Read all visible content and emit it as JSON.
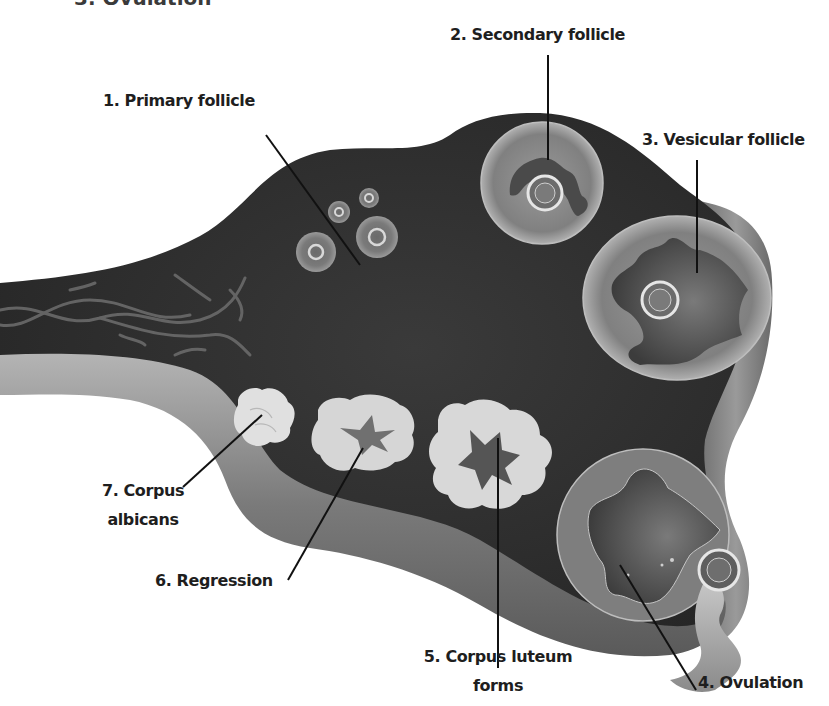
{
  "title_clipped": "3. Ovulation",
  "colors": {
    "background": "#ffffff",
    "ovary_body": "#2e2e2e",
    "ovary_dark": "#222222",
    "capsule_light": "#9a9a9a",
    "capsule_mid": "#6e6e6e",
    "follicle_fill": "#8c8c8c",
    "corpus_fill": "#d9d9d9",
    "leader_line": "#111111",
    "label_text": "#1e1e1e"
  },
  "labels": {
    "primary": "1. Primary follicle",
    "secondary": "2. Secondary follicle",
    "vesicular": "3. Vesicular follicle",
    "ovulation": "4. Ovulation",
    "corpus_luteum_line1": "5. Corpus luteum",
    "corpus_luteum_line2": "forms",
    "regression": "6. Regression",
    "corpus_albicans_line1": "7. Corpus",
    "corpus_albicans_line2": "albicans"
  }
}
